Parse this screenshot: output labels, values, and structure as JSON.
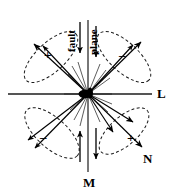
{
  "figure": {
    "background_color": "#ffffff",
    "stroke_color": "#000000",
    "axis_color": "#4d4d4d",
    "width": 179,
    "height": 196
  },
  "axes": {
    "center": {
      "x": 88,
      "y": 94
    },
    "horizontal": {
      "label": "L",
      "x1": 8,
      "y1": 94,
      "x2": 152,
      "y2": 94
    },
    "vertical": {
      "label": "M",
      "x1": 88,
      "y1": 20,
      "x2": 88,
      "y2": 172
    },
    "diagonal": {
      "label": "N"
    }
  },
  "labels": {
    "L": "L",
    "M": "M",
    "N": "N",
    "fault": "fault",
    "plane": "plane"
  },
  "lobes": [
    {
      "name": "upper-left",
      "sign": "+",
      "angle_deg": 225,
      "polarity": "compression"
    },
    {
      "name": "upper-right",
      "sign": "–",
      "angle_deg": 315,
      "polarity": "dilatation"
    },
    {
      "name": "lower-left",
      "sign": "–",
      "angle_deg": 135,
      "polarity": "dilatation"
    },
    {
      "name": "lower-right",
      "sign": "+",
      "angle_deg": 45,
      "polarity": "compression"
    }
  ],
  "shear_arrows": {
    "top_left_down": "fault arrow pointing down",
    "top_right_down": "plane arrow pointing down",
    "bottom_left_up": "shear arrow pointing up",
    "bottom_right_down": "shear arrow pointing down"
  }
}
